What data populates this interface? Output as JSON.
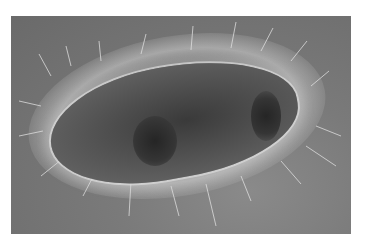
{
  "image": {
    "subject": "ciliated protozoan micrograph",
    "alt": "Grayscale light micrograph of an oval ciliated single-celled organism surrounded by cilia",
    "colors": {
      "background": "#ffffff",
      "photo_gray": "#7a7a7a",
      "cell_dark": "#3a3a3a",
      "cilia_light": "#e1e1e1"
    }
  }
}
